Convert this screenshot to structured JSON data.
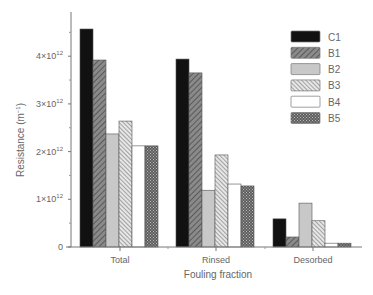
{
  "chart_data": {
    "type": "bar",
    "title": "",
    "xlabel": "Fouling fraction",
    "ylabel": "Resistance (m⁻¹)",
    "categories": [
      "Total",
      "Rinsed",
      "Desorbed"
    ],
    "series": [
      {
        "name": "C1",
        "pattern": "solid-black",
        "values": [
          4570000000000.0,
          3940000000000.0,
          590000000000.0
        ]
      },
      {
        "name": "B1",
        "pattern": "dense-diagonal-dark",
        "values": [
          3920000000000.0,
          3650000000000.0,
          210000000000.0
        ]
      },
      {
        "name": "B2",
        "pattern": "solid-light-gray",
        "values": [
          2370000000000.0,
          1190000000000.0,
          920000000000.0
        ]
      },
      {
        "name": "B3",
        "pattern": "diagonal-hatch",
        "values": [
          2640000000000.0,
          1930000000000.0,
          550000000000.0
        ]
      },
      {
        "name": "B4",
        "pattern": "white",
        "values": [
          2120000000000.0,
          1320000000000.0,
          80000000000.0
        ]
      },
      {
        "name": "B5",
        "pattern": "crosshatch-dark",
        "values": [
          2120000000000.0,
          1280000000000.0,
          80000000000.0
        ]
      }
    ],
    "yticks": [
      {
        "value": 0,
        "label": "0"
      },
      {
        "value": 1000000000000.0,
        "label": "1×10",
        "exp": "12"
      },
      {
        "value": 2000000000000.0,
        "label": "2×10",
        "exp": "12"
      },
      {
        "value": 3000000000000.0,
        "label": "3×10",
        "exp": "12"
      },
      {
        "value": 4000000000000.0,
        "label": "4×10",
        "exp": "12"
      }
    ],
    "ylim": [
      0,
      4800000000000.0
    ],
    "grid": false,
    "legend_position": "upper-right"
  },
  "axes": {
    "ylabel_main": "Resistance (m",
    "ylabel_exp": "−1",
    "ylabel_close": ")",
    "xlabel": "Fouling fraction"
  }
}
